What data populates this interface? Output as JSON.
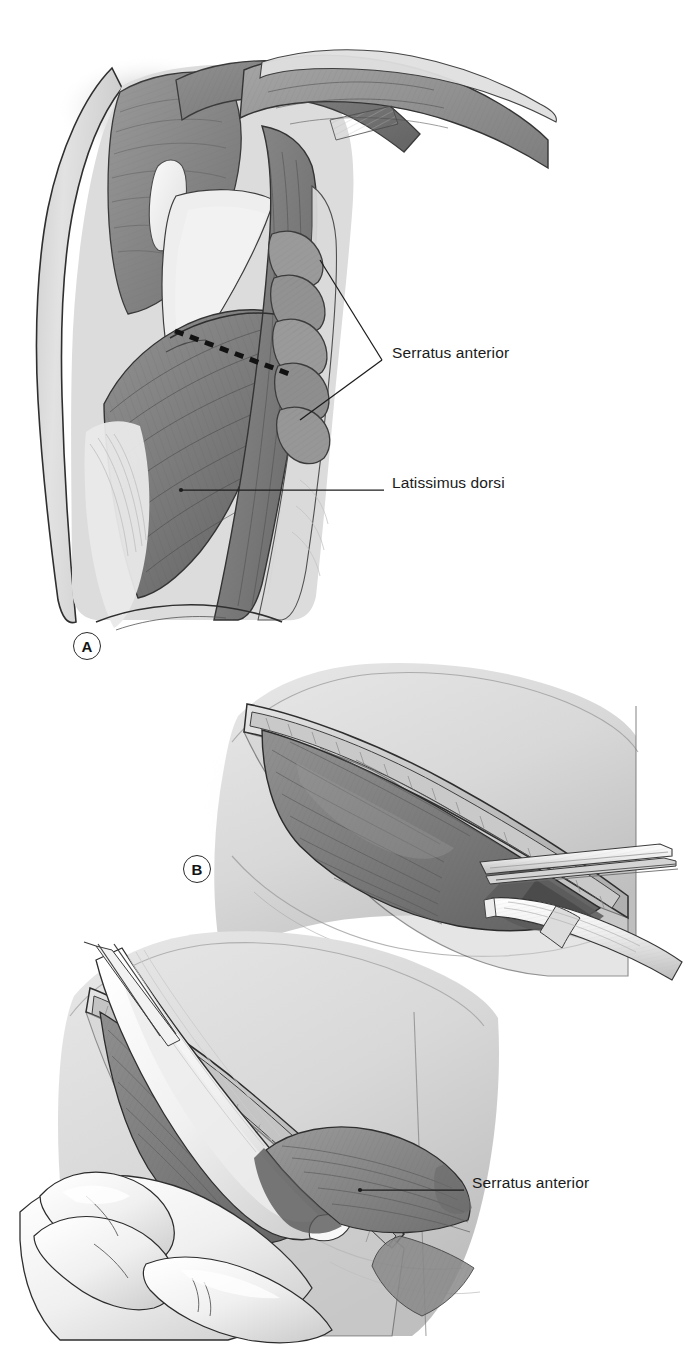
{
  "figure": {
    "medium": "grayscale medical illustration",
    "width": 693,
    "height": 1349,
    "background_color": "#ffffff"
  },
  "palette": {
    "ink": "#1a1a1a",
    "outline": "#2b2b2b",
    "muscle_mid": "#8c8c8c",
    "muscle_dark": "#6f6f6f",
    "muscle_darker": "#5e5e5e",
    "muscle_light": "#a6a6a6",
    "fascia_light": "#d6d6d6",
    "fascia_pale": "#e6e6e6",
    "skin_light": "#dedede",
    "skin_shadow": "#c4c4c4",
    "tendon_white": "#f4f4f4",
    "instrument_white": "#fafafa",
    "instrument_shade": "#cfcfcf",
    "glove_white": "#f7f7f7",
    "dashed_line": "#121212"
  },
  "panels": [
    {
      "id": "panel-a",
      "letter": "A",
      "letter_position": {
        "x": 73,
        "y": 632
      },
      "description": "Surface anatomy of the posterior-lateral chest wall and axilla showing latissimus dorsi, serratus anterior digitations over the ribs, and a dashed planned incision line",
      "region": {
        "x": 20,
        "y": 40,
        "width": 340,
        "height": 600
      }
    },
    {
      "id": "panel-b",
      "letter": "B",
      "letter_position": {
        "x": 183,
        "y": 855
      },
      "description": "Elliptical incision opened, latissimus dorsi muscle exposed; forceps and electrocautery handpiece entering the wound from the right",
      "region": {
        "x": 180,
        "y": 660,
        "width": 460,
        "height": 300
      }
    },
    {
      "id": "panel-c",
      "letter": "",
      "letter_position": null,
      "description": "Latissimus dorsi retracted with a flat retractor blade and held by a gloved hand, exposing serratus anterior beneath",
      "region": {
        "x": 20,
        "y": 930,
        "width": 480,
        "height": 410
      }
    }
  ],
  "labels": [
    {
      "id": "label-serratus-anterior-a",
      "text": "Serratus anterior",
      "text_position": {
        "x": 392,
        "y": 353
      },
      "leader_type": "bracket-v",
      "leader": {
        "apex": {
          "x": 382,
          "y": 360
        },
        "targets": [
          {
            "x": 320,
            "y": 260
          },
          {
            "x": 300,
            "y": 420
          }
        ]
      }
    },
    {
      "id": "label-latissimus-dorsi-a",
      "text": "Latissimus dorsi",
      "text_position": {
        "x": 392,
        "y": 483
      },
      "leader_type": "straight",
      "leader": {
        "from": {
          "x": 384,
          "y": 490
        },
        "to": {
          "x": 181,
          "y": 490
        }
      }
    },
    {
      "id": "label-serratus-anterior-c",
      "text": "Serratus anterior",
      "text_position": {
        "x": 472,
        "y": 1183
      },
      "leader_type": "straight",
      "leader": {
        "from": {
          "x": 464,
          "y": 1190
        },
        "to": {
          "x": 360,
          "y": 1190
        }
      }
    }
  ],
  "annotations": {
    "incision_line": {
      "id": "planned-incision",
      "style": "dashed",
      "from": {
        "x": 175,
        "y": 331
      },
      "to": {
        "x": 292,
        "y": 375
      },
      "dash": "9 7",
      "width": 5
    }
  },
  "instruments": [
    {
      "id": "forceps",
      "name": "tissue-forceps",
      "panel": "panel-b"
    },
    {
      "id": "cautery",
      "name": "electrocautery-handpiece",
      "panel": "panel-b"
    },
    {
      "id": "retractor",
      "name": "retractor-blade",
      "panel": "panel-c"
    },
    {
      "id": "gloved-hand",
      "name": "surgeon-gloved-hand",
      "panel": "panel-c"
    }
  ],
  "anatomy_structures": [
    {
      "name": "Latissimus dorsi",
      "panel": "panel-a"
    },
    {
      "name": "Serratus anterior",
      "panel": "panel-a"
    },
    {
      "name": "Ribs",
      "panel": "panel-a"
    },
    {
      "name": "Scapula",
      "panel": "panel-a"
    },
    {
      "name": "Teres major",
      "panel": "panel-a"
    },
    {
      "name": "Triceps brachii",
      "panel": "panel-a"
    },
    {
      "name": "Deltoid",
      "panel": "panel-a"
    },
    {
      "name": "Serratus anterior",
      "panel": "panel-c"
    }
  ]
}
